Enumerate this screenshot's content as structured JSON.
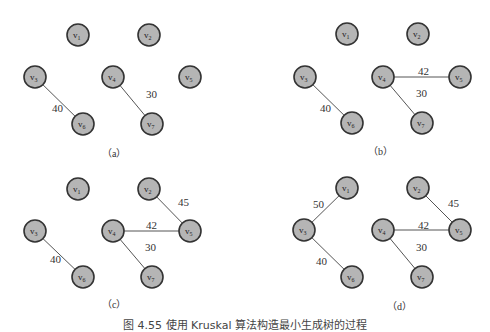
{
  "figure": {
    "caption": "图 4.55   使用 Kruskal 算法构造最小生成树的过程",
    "colors": {
      "node_fill": "#b5b5b5",
      "node_stroke": "#333333",
      "edge": "#555555"
    },
    "panels": [
      {
        "label": "（a）",
        "offset": [
          0,
          0
        ],
        "label_pos": [
          112,
          157
        ],
        "nodes": [
          {
            "id": "v1",
            "x": 78,
            "y": 35
          },
          {
            "id": "v2",
            "x": 149,
            "y": 35
          },
          {
            "id": "v3",
            "x": 35,
            "y": 77
          },
          {
            "id": "v4",
            "x": 113,
            "y": 77
          },
          {
            "id": "v5",
            "x": 190,
            "y": 77
          },
          {
            "id": "v6",
            "x": 83,
            "y": 124
          },
          {
            "id": "v7",
            "x": 152,
            "y": 124
          }
        ],
        "edges": [
          {
            "from": "v3",
            "to": "v6",
            "weight": "40",
            "lx": 52,
            "ly": 112
          },
          {
            "from": "v4",
            "to": "v7",
            "weight": "30",
            "lx": 146,
            "ly": 98
          }
        ]
      },
      {
        "label": "（b）",
        "offset": [
          0,
          0
        ],
        "label_pos": [
          378,
          155
        ],
        "nodes": [
          {
            "id": "v1",
            "x": 347,
            "y": 34
          },
          {
            "id": "v2",
            "x": 418,
            "y": 34
          },
          {
            "id": "v3",
            "x": 305,
            "y": 77
          },
          {
            "id": "v4",
            "x": 383,
            "y": 77
          },
          {
            "id": "v5",
            "x": 460,
            "y": 77
          },
          {
            "id": "v6",
            "x": 352,
            "y": 123
          },
          {
            "id": "v7",
            "x": 422,
            "y": 123
          }
        ],
        "edges": [
          {
            "from": "v3",
            "to": "v6",
            "weight": "40",
            "lx": 320,
            "ly": 112
          },
          {
            "from": "v4",
            "to": "v5",
            "weight": "42",
            "lx": 418,
            "ly": 75
          },
          {
            "from": "v4",
            "to": "v7",
            "weight": "30",
            "lx": 416,
            "ly": 97
          }
        ]
      },
      {
        "label": "（c）",
        "offset": [
          0,
          0
        ],
        "label_pos": [
          112,
          308
        ],
        "nodes": [
          {
            "id": "v1",
            "x": 78,
            "y": 189
          },
          {
            "id": "v2",
            "x": 149,
            "y": 189
          },
          {
            "id": "v3",
            "x": 35,
            "y": 231
          },
          {
            "id": "v4",
            "x": 113,
            "y": 231
          },
          {
            "id": "v5",
            "x": 190,
            "y": 231
          },
          {
            "id": "v6",
            "x": 83,
            "y": 277
          },
          {
            "id": "v7",
            "x": 152,
            "y": 277
          }
        ],
        "edges": [
          {
            "from": "v3",
            "to": "v6",
            "weight": "40",
            "lx": 50,
            "ly": 263
          },
          {
            "from": "v4",
            "to": "v5",
            "weight": "42",
            "lx": 146,
            "ly": 229
          },
          {
            "from": "v4",
            "to": "v7",
            "weight": "30",
            "lx": 145,
            "ly": 251
          },
          {
            "from": "v2",
            "to": "v5",
            "weight": "45",
            "lx": 178,
            "ly": 206
          }
        ]
      },
      {
        "label": "（d）",
        "offset": [
          0,
          0
        ],
        "label_pos": [
          397,
          310
        ],
        "nodes": [
          {
            "id": "v1",
            "x": 347,
            "y": 188
          },
          {
            "id": "v3",
            "x": 304,
            "y": 230
          },
          {
            "id": "v2",
            "x": 418,
            "y": 188
          },
          {
            "id": "v4",
            "x": 383,
            "y": 230
          },
          {
            "id": "v5",
            "x": 460,
            "y": 230
          },
          {
            "id": "v6",
            "x": 352,
            "y": 277
          },
          {
            "id": "v7",
            "x": 422,
            "y": 277
          }
        ],
        "edges": [
          {
            "from": "v1",
            "to": "v3",
            "weight": "50",
            "lx": 313,
            "ly": 208
          },
          {
            "from": "v3",
            "to": "v6",
            "weight": "40",
            "lx": 316,
            "ly": 265
          },
          {
            "from": "v4",
            "to": "v5",
            "weight": "42",
            "lx": 418,
            "ly": 229
          },
          {
            "from": "v4",
            "to": "v7",
            "weight": "30",
            "lx": 416,
            "ly": 251
          },
          {
            "from": "v2",
            "to": "v5",
            "weight": "45",
            "lx": 448,
            "ly": 207
          }
        ]
      }
    ]
  }
}
